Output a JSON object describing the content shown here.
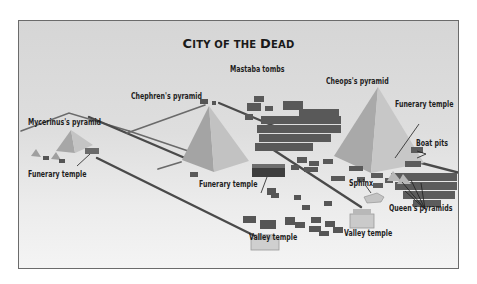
{
  "diagram": {
    "title": "City of the Dead",
    "title_display": [
      "C",
      "ITY OF THE ",
      "D",
      "EAD"
    ],
    "labels": {
      "mastaba_tombs": "Mastaba tombs",
      "cheops_pyramid": "Cheops's pyramid",
      "chephren_pyramid": "Chephren's pyramid",
      "mycerinus_pyramid": "Mycerinus's pyramid",
      "funerary_temple_cheops": "Funerary temple",
      "boat_pits": "Boat pits",
      "funerary_temple_mycerinus": "Funerary temple",
      "funerary_temple_chephren": "Funerary temple",
      "sphinx": "Sphinx",
      "queens_pyramids": "Queen's pyramids",
      "valley_temple_chephren": "Valley temple",
      "valley_temple_cheops": "Valley temple"
    },
    "colors": {
      "background": "#dcdcdc",
      "pyramid_light": "#b9b9b9",
      "pyramid_dark": "#9a9a9a",
      "causeway": "#4a4a4a",
      "tomb": "#5a5a5a",
      "temple_light": "#cfcfcf",
      "frame_border": "#6b6b6b"
    }
  }
}
